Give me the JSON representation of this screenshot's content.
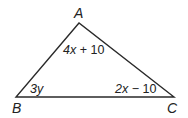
{
  "diagram": {
    "type": "triangle",
    "stroke_color": "#2a2a2a",
    "vertices": [
      {
        "name": "A",
        "x": 79,
        "y": 23
      },
      {
        "name": "B",
        "x": 16,
        "y": 97
      },
      {
        "name": "C",
        "x": 174,
        "y": 97
      }
    ],
    "vertex_labels": {
      "A": "A",
      "B": "B",
      "C": "C"
    },
    "angle_labels": {
      "A": {
        "var": "4x",
        "rest": " + 10"
      },
      "B": {
        "var": "3y",
        "rest": ""
      },
      "C": {
        "var": "2x",
        "rest": " − 10"
      }
    }
  }
}
